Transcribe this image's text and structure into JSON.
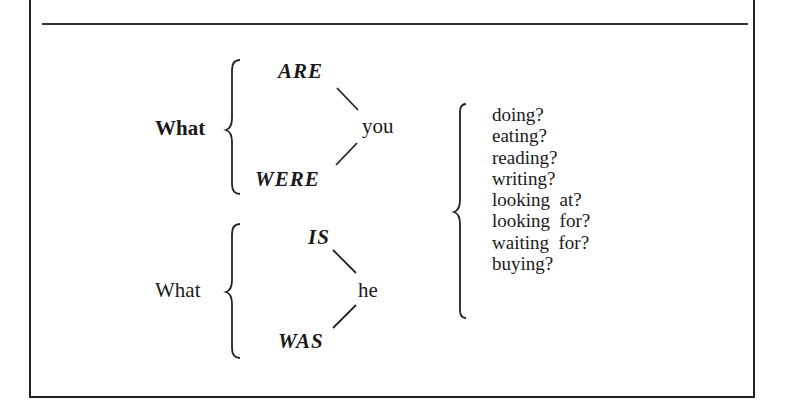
{
  "group1": {
    "lead": "What",
    "upper_verb": "ARE",
    "lower_verb": "WERE",
    "subject": "you"
  },
  "group2": {
    "lead": "What",
    "upper_verb": "IS",
    "lower_verb": "WAS",
    "subject": "he"
  },
  "completions": [
    "doing?",
    "eating?",
    "reading?",
    "writing?",
    "looking  at?",
    "looking  for?",
    "waiting  for?",
    "buying?"
  ]
}
